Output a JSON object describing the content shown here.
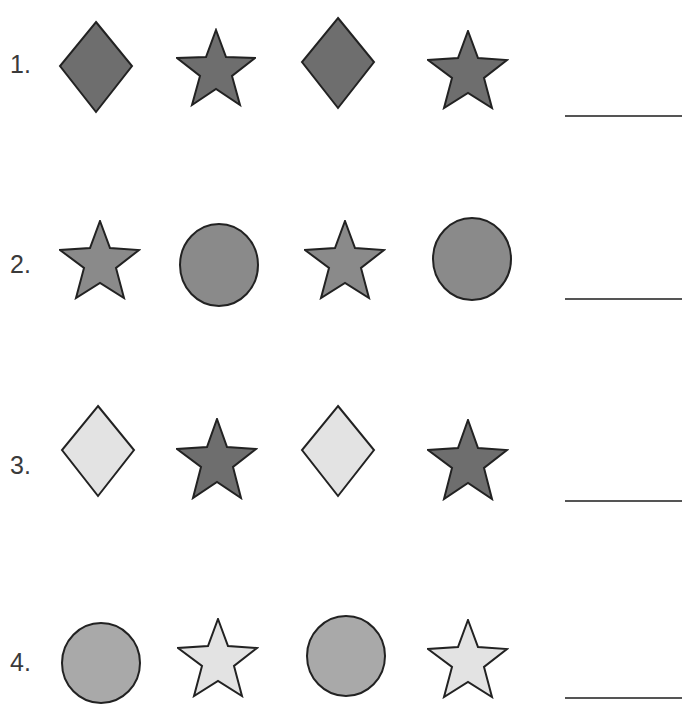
{
  "worksheet": {
    "colors": {
      "dark": "#6e6e6e",
      "medium": "#8a8a8a",
      "circle_light": "#a9a9a9",
      "light": "#e3e3e3",
      "stroke": "#222222"
    },
    "rows": [
      {
        "number": "1.",
        "shapes": [
          {
            "type": "diamond",
            "fill": "dark"
          },
          {
            "type": "star",
            "fill": "dark"
          },
          {
            "type": "diamond",
            "fill": "dark"
          },
          {
            "type": "star",
            "fill": "dark"
          }
        ],
        "answer": ""
      },
      {
        "number": "2.",
        "shapes": [
          {
            "type": "star",
            "fill": "medium"
          },
          {
            "type": "circle",
            "fill": "medium"
          },
          {
            "type": "star",
            "fill": "medium"
          },
          {
            "type": "circle",
            "fill": "medium"
          }
        ],
        "answer": ""
      },
      {
        "number": "3.",
        "shapes": [
          {
            "type": "diamond",
            "fill": "light"
          },
          {
            "type": "star",
            "fill": "dark"
          },
          {
            "type": "diamond",
            "fill": "light"
          },
          {
            "type": "star",
            "fill": "dark"
          }
        ],
        "answer": ""
      },
      {
        "number": "4.",
        "shapes": [
          {
            "type": "circle",
            "fill": "circle_light"
          },
          {
            "type": "star",
            "fill": "light"
          },
          {
            "type": "circle",
            "fill": "circle_light"
          },
          {
            "type": "star",
            "fill": "light"
          }
        ],
        "answer": ""
      }
    ]
  }
}
